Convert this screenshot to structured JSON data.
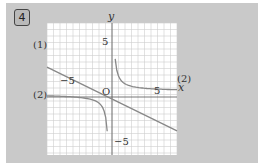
{
  "problem": {
    "number": "4"
  },
  "chart_data": {
    "type": "line",
    "title": "",
    "xlabel": "x",
    "ylabel": "y",
    "origin_label": "O",
    "xlim": [
      -10,
      10
    ],
    "ylim": [
      -9,
      11
    ],
    "grid": true,
    "x_ticks": [
      {
        "value": -5,
        "label": "−5"
      },
      {
        "value": 5,
        "label": "5"
      }
    ],
    "y_ticks": [
      {
        "value": 5,
        "label": "5"
      },
      {
        "value": -5,
        "label": "−5"
      }
    ],
    "series": [
      {
        "name": "(1)",
        "kind": "line",
        "points": [
          [
            -10,
            4.6
          ],
          [
            10,
            -5.2
          ]
        ]
      },
      {
        "name": "(2)",
        "kind": "hyperbola",
        "points_right": [
          [
            0.8,
            11
          ],
          [
            1.5,
            4
          ],
          [
            3,
            2
          ],
          [
            6,
            1.3
          ],
          [
            10,
            1
          ]
        ],
        "points_left": [
          [
            -10,
            0.2
          ],
          [
            -6,
            -0.4
          ],
          [
            -3,
            -1.2
          ],
          [
            -1.5,
            -3
          ],
          [
            -0.8,
            -9
          ]
        ]
      }
    ],
    "labels": {
      "curve1": "(1)",
      "curve2_right": "(2)",
      "curve2_left": "(2)"
    }
  }
}
